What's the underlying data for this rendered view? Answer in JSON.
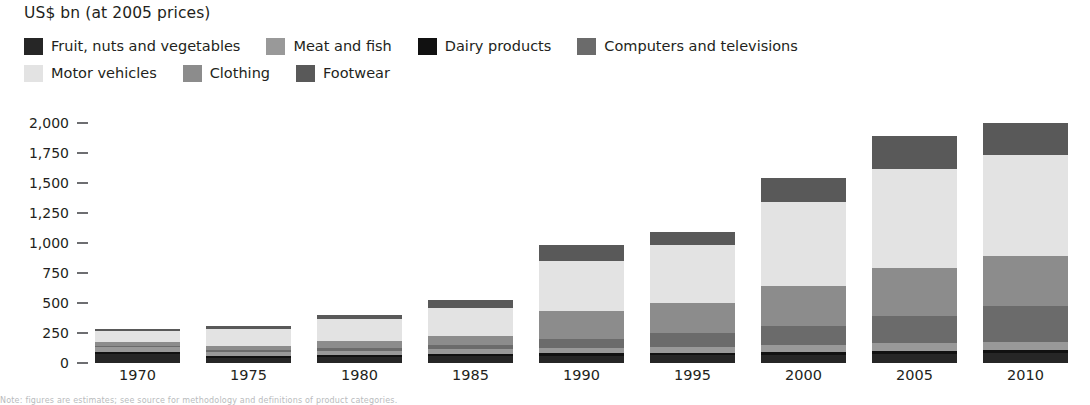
{
  "chart_data": {
    "type": "bar",
    "subtype": "stacked-bar",
    "title": "US$ bn (at 2005 prices)",
    "xlabel": "",
    "ylabel": "US$ bn (at 2005 prices)",
    "ylim": [
      0,
      2000
    ],
    "ytick_step": 250,
    "grid": false,
    "legend_position": "top",
    "categories": [
      "1970",
      "1975",
      "1980",
      "1985",
      "1990",
      "1995",
      "2000",
      "2005",
      "2010"
    ],
    "ytick_labels": [
      "2,000",
      "1,750",
      "1,500",
      "1,250",
      "1,000",
      "750",
      "500",
      "250",
      "0"
    ],
    "ytick_values": [
      2000,
      1750,
      1500,
      1250,
      1000,
      750,
      500,
      250,
      0
    ],
    "series": [
      {
        "name": "Fruit, nuts and vegetables",
        "color": "#262626",
        "values": [
          75,
          45,
          50,
          55,
          60,
          65,
          70,
          75,
          80
        ]
      },
      {
        "name": "Meat and fish",
        "color": "#999999",
        "values": [
          40,
          30,
          35,
          40,
          45,
          50,
          55,
          60,
          65
        ]
      },
      {
        "name": "Dairy products",
        "color": "#111111",
        "values": [
          20,
          15,
          15,
          18,
          20,
          22,
          25,
          28,
          30
        ]
      },
      {
        "name": "Computers and televisions",
        "color": "#6b6b6b",
        "values": [
          10,
          15,
          25,
          40,
          75,
          110,
          160,
          230,
          300
        ]
      },
      {
        "name": "Motor vehicles",
        "color": "#e3e3e3",
        "values": [
          90,
          140,
          185,
          230,
          420,
          490,
          700,
          820,
          840
        ]
      },
      {
        "name": "Clothing",
        "color": "#8c8c8c",
        "values": [
          30,
          40,
          55,
          75,
          230,
          250,
          330,
          400,
          420
        ]
      },
      {
        "name": "Footwear",
        "color": "#595959",
        "values": [
          15,
          25,
          35,
          67,
          130,
          103,
          200,
          277,
          265
        ]
      }
    ],
    "totals": [
      280,
      310,
      400,
      525,
      980,
      1090,
      1540,
      1890,
      2000
    ]
  },
  "legend": {
    "rows": [
      [
        {
          "label": "Fruit, nuts and vegetables",
          "color": "#262626"
        },
        {
          "label": "Meat and fish",
          "color": "#999999"
        },
        {
          "label": "Dairy products",
          "color": "#111111"
        },
        {
          "label": "Computers and televisions",
          "color": "#6b6b6b"
        }
      ],
      [
        {
          "label": "Motor vehicles",
          "color": "#e3e3e3"
        },
        {
          "label": "Clothing",
          "color": "#8c8c8c"
        },
        {
          "label": "Footwear",
          "color": "#595959"
        }
      ]
    ]
  },
  "caption": {
    "text": "Note: figures are estimates; see source for methodology and definitions of product categories."
  }
}
